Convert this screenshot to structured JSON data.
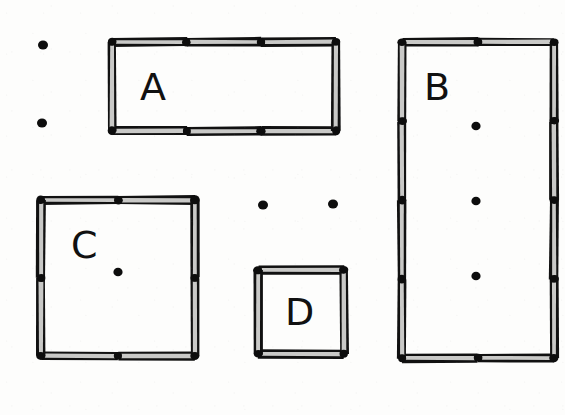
{
  "figure": {
    "kind": "hand-drawn-floorplan-sketch",
    "background_color": "#fdfdfc",
    "wall_outline_color": "#111111",
    "wall_fill_color": "#c9c9c7",
    "joint_color": "#0d0d0d",
    "width": 565,
    "height": 415
  },
  "rooms": [
    {
      "id": "room-a",
      "label": "A",
      "label_x": 140,
      "label_y": 100,
      "x": 112,
      "y": 42,
      "w": 224,
      "h": 89,
      "wall_thickness": 9,
      "h_segments": 3,
      "v_segments": 1,
      "interior_dots": []
    },
    {
      "id": "room-b",
      "label": "B",
      "label_x": 424,
      "label_y": 100,
      "x": 402,
      "y": 42,
      "w": 152,
      "h": 316,
      "wall_thickness": 9,
      "h_segments": 2,
      "v_segments": 4,
      "interior_dots": [
        {
          "x": 476,
          "y": 126
        },
        {
          "x": 476,
          "y": 201
        },
        {
          "x": 476,
          "y": 276
        }
      ]
    },
    {
      "id": "room-c",
      "label": "C",
      "label_x": 71,
      "label_y": 258,
      "x": 41,
      "y": 200,
      "w": 154,
      "h": 156,
      "wall_thickness": 9,
      "h_segments": 2,
      "v_segments": 2,
      "interior_dots": [
        {
          "x": 118,
          "y": 272
        }
      ]
    },
    {
      "id": "room-d",
      "label": "D",
      "label_x": 285,
      "label_y": 325,
      "x": 258,
      "y": 270,
      "w": 86,
      "h": 84,
      "wall_thickness": 9,
      "h_segments": 1,
      "v_segments": 1,
      "interior_dots": []
    }
  ],
  "loose_dots": [
    {
      "id": "loose-dot-1",
      "x": 43,
      "y": 45,
      "r": 5
    },
    {
      "id": "loose-dot-2",
      "x": 42,
      "y": 123,
      "r": 5
    },
    {
      "id": "loose-dot-3",
      "x": 263,
      "y": 205,
      "r": 5
    },
    {
      "id": "loose-dot-4",
      "x": 333,
      "y": 204,
      "r": 5
    }
  ]
}
